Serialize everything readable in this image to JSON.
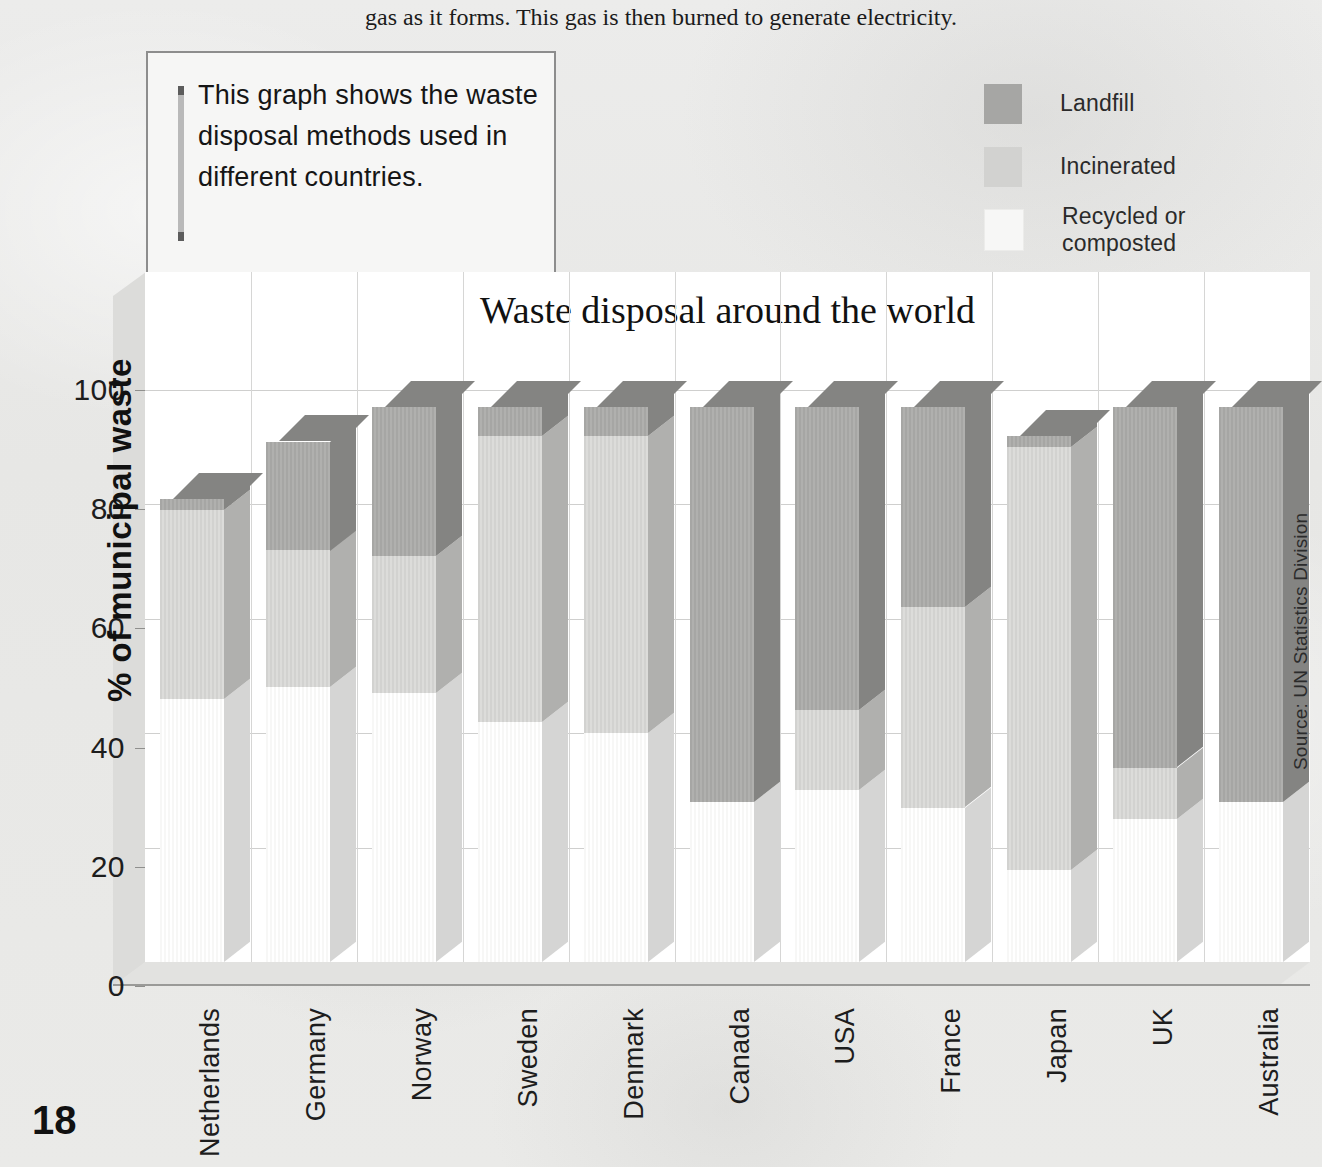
{
  "intro_text": "gas as it forms. This gas is then burned to generate electricity.",
  "note": {
    "text": "This graph shows the waste disposal methods used in different countries."
  },
  "page_number": "18",
  "source_note": "Source: UN Statistics Division",
  "legend": {
    "items": [
      {
        "label": "Landfill",
        "color": "#a6a6a4"
      },
      {
        "label": "Incinerated",
        "color": "#d2d2d0"
      },
      {
        "label": "Recycled or composted",
        "color": "#f7f7f6"
      }
    ]
  },
  "chart_data": {
    "type": "bar",
    "subtype": "stacked-3d-column",
    "title": "Waste disposal around the world",
    "xlabel": "",
    "ylabel": "% of municipal waste",
    "ylim": [
      0,
      100
    ],
    "yticks": [
      0,
      20,
      40,
      60,
      80,
      100
    ],
    "ytick_labels": [
      "0",
      "20",
      "40",
      "60",
      "80",
      "100"
    ],
    "grid": true,
    "legend_position": "top-right",
    "source": "UN Statistics Division",
    "categories": [
      "Netherlands",
      "Germany",
      "Norway",
      "Sweden",
      "Denmark",
      "Canada",
      "USA",
      "France",
      "Japan",
      "UK",
      "Australia"
    ],
    "series": [
      {
        "name": "Recycled or composted",
        "color": "#f7f7f6",
        "values": [
          46,
          48,
          47,
          42,
          40,
          28,
          30,
          27,
          16,
          25,
          28
        ]
      },
      {
        "name": "Incinerated",
        "color": "#d2d2d0",
        "values": [
          33,
          24,
          24,
          50,
          52,
          0,
          14,
          35,
          74,
          9,
          0
        ]
      },
      {
        "name": "Landfill",
        "color": "#a6a6a4",
        "values": [
          2,
          19,
          26,
          5,
          5,
          69,
          53,
          35,
          2,
          63,
          69
        ]
      }
    ],
    "totals": [
      81,
      91,
      97,
      97,
      97,
      97,
      97,
      97,
      92,
      97,
      97
    ]
  }
}
